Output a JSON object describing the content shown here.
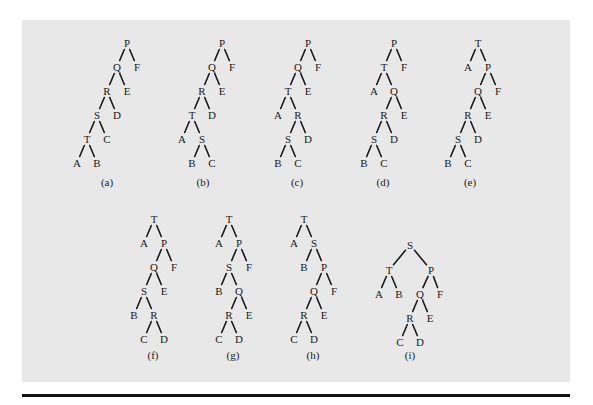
{
  "figure": {
    "panel_color": "#e8e8e8",
    "rule_color": "#111111",
    "trees": [
      {
        "label": "(a)",
        "label_pos": [
          107,
          186
        ],
        "nodes": {
          "P": [
            127,
            43
          ],
          "Q": [
            117,
            67
          ],
          "F": [
            137,
            67
          ],
          "R": [
            107,
            91
          ],
          "E": [
            127,
            91
          ],
          "S": [
            97,
            115
          ],
          "D": [
            117,
            115
          ],
          "T": [
            87,
            139
          ],
          "C": [
            107,
            139
          ],
          "A": [
            77,
            163
          ],
          "B": [
            97,
            163
          ]
        },
        "edges": [
          [
            "P",
            "Q"
          ],
          [
            "P",
            "F"
          ],
          [
            "Q",
            "R"
          ],
          [
            "Q",
            "E"
          ],
          [
            "R",
            "S"
          ],
          [
            "R",
            "D"
          ],
          [
            "S",
            "T"
          ],
          [
            "S",
            "C"
          ],
          [
            "T",
            "A"
          ],
          [
            "T",
            "B"
          ]
        ]
      },
      {
        "label": "(b)",
        "label_pos": [
          203,
          186
        ],
        "nodes": {
          "P": [
            222,
            43
          ],
          "Q": [
            212,
            67
          ],
          "F": [
            232,
            67
          ],
          "R": [
            202,
            91
          ],
          "E": [
            222,
            91
          ],
          "T": [
            192,
            115
          ],
          "D": [
            212,
            115
          ],
          "A": [
            182,
            139
          ],
          "S": [
            202,
            139
          ],
          "B": [
            192,
            163
          ],
          "C": [
            212,
            163
          ]
        },
        "edges": [
          [
            "P",
            "Q"
          ],
          [
            "P",
            "F"
          ],
          [
            "Q",
            "R"
          ],
          [
            "Q",
            "E"
          ],
          [
            "R",
            "T"
          ],
          [
            "R",
            "D"
          ],
          [
            "T",
            "A"
          ],
          [
            "T",
            "S"
          ],
          [
            "S",
            "B"
          ],
          [
            "S",
            "C"
          ]
        ]
      },
      {
        "label": "(c)",
        "label_pos": [
          297,
          186
        ],
        "nodes": {
          "P": [
            308,
            43
          ],
          "Q": [
            298,
            67
          ],
          "F": [
            318,
            67
          ],
          "T": [
            288,
            91
          ],
          "E": [
            308,
            91
          ],
          "A": [
            278,
            115
          ],
          "R": [
            298,
            115
          ],
          "S": [
            288,
            139
          ],
          "D": [
            308,
            139
          ],
          "B": [
            278,
            163
          ],
          "C": [
            298,
            163
          ]
        },
        "edges": [
          [
            "P",
            "Q"
          ],
          [
            "P",
            "F"
          ],
          [
            "Q",
            "T"
          ],
          [
            "Q",
            "E"
          ],
          [
            "T",
            "A"
          ],
          [
            "T",
            "R"
          ],
          [
            "R",
            "S"
          ],
          [
            "R",
            "D"
          ],
          [
            "S",
            "B"
          ],
          [
            "S",
            "C"
          ]
        ]
      },
      {
        "label": "(d)",
        "label_pos": [
          383,
          186
        ],
        "nodes": {
          "P": [
            394,
            43
          ],
          "T": [
            384,
            67
          ],
          "F": [
            404,
            67
          ],
          "A": [
            374,
            91
          ],
          "Q": [
            394,
            91
          ],
          "R": [
            384,
            115
          ],
          "E": [
            404,
            115
          ],
          "S": [
            374,
            139
          ],
          "D": [
            394,
            139
          ],
          "B": [
            364,
            163
          ],
          "C": [
            384,
            163
          ]
        },
        "edges": [
          [
            "P",
            "T"
          ],
          [
            "P",
            "F"
          ],
          [
            "T",
            "A"
          ],
          [
            "T",
            "Q"
          ],
          [
            "Q",
            "R"
          ],
          [
            "Q",
            "E"
          ],
          [
            "R",
            "S"
          ],
          [
            "R",
            "D"
          ],
          [
            "S",
            "B"
          ],
          [
            "S",
            "C"
          ]
        ]
      },
      {
        "label": "(e)",
        "label_pos": [
          470,
          186
        ],
        "nodes": {
          "T": [
            478,
            43
          ],
          "A": [
            468,
            67
          ],
          "P": [
            488,
            67
          ],
          "Q": [
            478,
            91
          ],
          "F": [
            498,
            91
          ],
          "R": [
            468,
            115
          ],
          "E": [
            488,
            115
          ],
          "S": [
            458,
            139
          ],
          "D": [
            478,
            139
          ],
          "B": [
            448,
            163
          ],
          "C": [
            468,
            163
          ]
        },
        "edges": [
          [
            "T",
            "A"
          ],
          [
            "T",
            "P"
          ],
          [
            "P",
            "Q"
          ],
          [
            "P",
            "F"
          ],
          [
            "Q",
            "R"
          ],
          [
            "Q",
            "E"
          ],
          [
            "R",
            "S"
          ],
          [
            "R",
            "D"
          ],
          [
            "S",
            "B"
          ],
          [
            "S",
            "C"
          ]
        ]
      },
      {
        "label": "(f)",
        "label_pos": [
          153,
          359
        ],
        "nodes": {
          "T": [
            154,
            219
          ],
          "A": [
            144,
            243
          ],
          "P": [
            164,
            243
          ],
          "Q": [
            154,
            267
          ],
          "F": [
            174,
            267
          ],
          "S": [
            144,
            291
          ],
          "E": [
            164,
            291
          ],
          "B": [
            134,
            315
          ],
          "R": [
            154,
            315
          ],
          "C": [
            144,
            339
          ],
          "D": [
            164,
            339
          ]
        },
        "edges": [
          [
            "T",
            "A"
          ],
          [
            "T",
            "P"
          ],
          [
            "P",
            "Q"
          ],
          [
            "P",
            "F"
          ],
          [
            "Q",
            "S"
          ],
          [
            "Q",
            "E"
          ],
          [
            "S",
            "B"
          ],
          [
            "S",
            "R"
          ],
          [
            "R",
            "C"
          ],
          [
            "R",
            "D"
          ]
        ]
      },
      {
        "label": "(g)",
        "label_pos": [
          233,
          359
        ],
        "nodes": {
          "T": [
            229,
            219
          ],
          "A": [
            219,
            243
          ],
          "P": [
            239,
            243
          ],
          "S": [
            229,
            267
          ],
          "F": [
            249,
            267
          ],
          "B": [
            219,
            291
          ],
          "Q": [
            239,
            291
          ],
          "R": [
            229,
            315
          ],
          "E": [
            249,
            315
          ],
          "C": [
            219,
            339
          ],
          "D": [
            239,
            339
          ]
        },
        "edges": [
          [
            "T",
            "A"
          ],
          [
            "T",
            "P"
          ],
          [
            "P",
            "S"
          ],
          [
            "P",
            "F"
          ],
          [
            "S",
            "B"
          ],
          [
            "S",
            "Q"
          ],
          [
            "Q",
            "R"
          ],
          [
            "Q",
            "E"
          ],
          [
            "R",
            "C"
          ],
          [
            "R",
            "D"
          ]
        ]
      },
      {
        "label": "(h)",
        "label_pos": [
          313,
          359
        ],
        "nodes": {
          "T": [
            304,
            219
          ],
          "A": [
            294,
            243
          ],
          "S": [
            314,
            243
          ],
          "B": [
            304,
            267
          ],
          "P": [
            324,
            267
          ],
          "Q": [
            314,
            291
          ],
          "F": [
            334,
            291
          ],
          "R": [
            304,
            315
          ],
          "E": [
            324,
            315
          ],
          "C": [
            294,
            339
          ],
          "D": [
            314,
            339
          ]
        },
        "edges": [
          [
            "T",
            "A"
          ],
          [
            "T",
            "S"
          ],
          [
            "S",
            "B"
          ],
          [
            "S",
            "P"
          ],
          [
            "P",
            "Q"
          ],
          [
            "P",
            "F"
          ],
          [
            "Q",
            "R"
          ],
          [
            "Q",
            "E"
          ],
          [
            "R",
            "C"
          ],
          [
            "R",
            "D"
          ]
        ]
      },
      {
        "label": "(i)",
        "label_pos": [
          410,
          359
        ],
        "nodes": {
          "S": [
            410,
            245
          ],
          "T": [
            389,
            270
          ],
          "P": [
            431,
            270
          ],
          "A": [
            379,
            294
          ],
          "B": [
            399,
            294
          ],
          "Q": [
            420,
            294
          ],
          "F": [
            440,
            294
          ],
          "R": [
            410,
            318
          ],
          "E": [
            430,
            318
          ],
          "C": [
            400,
            342
          ],
          "D": [
            420,
            342
          ]
        },
        "edges": [
          [
            "S",
            "T"
          ],
          [
            "S",
            "P"
          ],
          [
            "T",
            "A"
          ],
          [
            "T",
            "B"
          ],
          [
            "P",
            "Q"
          ],
          [
            "P",
            "F"
          ],
          [
            "Q",
            "R"
          ],
          [
            "Q",
            "E"
          ],
          [
            "R",
            "C"
          ],
          [
            "R",
            "D"
          ]
        ]
      }
    ]
  }
}
